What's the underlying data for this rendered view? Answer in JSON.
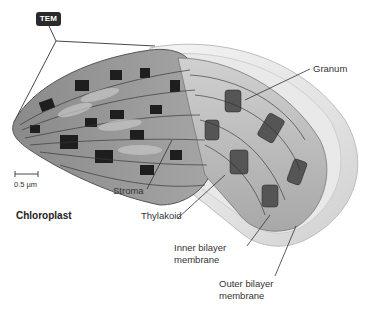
{
  "figure": {
    "title": "Chloroplast",
    "badge": "TEM",
    "scale_bar": "0.5 µm",
    "labels": {
      "granum": "Granum",
      "stroma": "Stroma",
      "thylakoid": "Thylakoid",
      "inner_membrane_line1": "Inner bilayer",
      "inner_membrane_line2": "membrane",
      "outer_membrane_line1": "Outer bilayer",
      "outer_membrane_line2": "membrane"
    }
  }
}
